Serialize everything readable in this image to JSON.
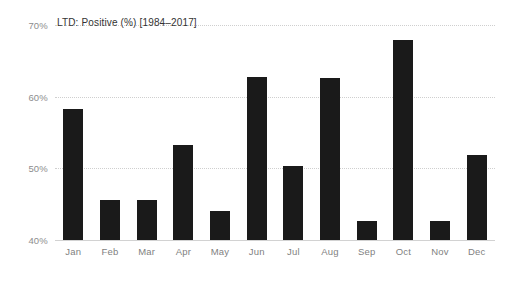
{
  "chart_data": {
    "type": "bar",
    "title": "LTD: Positive (%) [1984–2017]",
    "xlabel": "",
    "ylabel": "",
    "categories": [
      "Jan",
      "Feb",
      "Mar",
      "Apr",
      "May",
      "Jun",
      "Jul",
      "Aug",
      "Sep",
      "Oct",
      "Nov",
      "Dec"
    ],
    "values": [
      58.3,
      45.6,
      45.6,
      53.3,
      44.0,
      62.7,
      50.3,
      62.6,
      42.6,
      67.9,
      42.6,
      51.9
    ],
    "ylim": [
      40,
      70
    ],
    "ytick_labels": [
      "40%",
      "50%",
      "60%",
      "70%"
    ],
    "ytick_values": [
      40,
      50,
      60,
      70
    ],
    "grid": true,
    "legend": "none",
    "bar_color": "#1a1a1a",
    "gridline_color": "#cfcfcf",
    "tick_label_color": "#8d8d8d",
    "title_color": "#333333",
    "background_color": "#ffffff"
  }
}
